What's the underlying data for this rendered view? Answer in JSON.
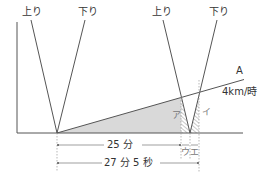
{
  "diagram": {
    "labels": {
      "up_1": "上り",
      "down_1": "下り",
      "up_2": "上り",
      "down_2": "下り",
      "line_a": "A",
      "speed": "4km/時",
      "region_a": "ア",
      "region_i": "イ",
      "seg_u": "ウ",
      "seg_e": "エ",
      "duration_1": "25 分",
      "duration_2": "27 分 5 秒"
    },
    "colors": {
      "line": "#555555",
      "shade": "#d9d9d9",
      "hatch": "#777777",
      "guide": "#999999"
    }
  }
}
